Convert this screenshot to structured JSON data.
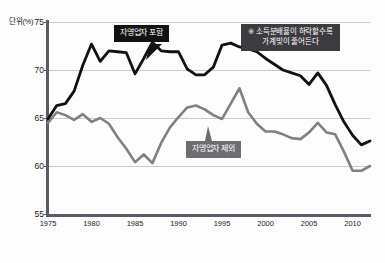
{
  "axis": {
    "unit_label": "단위(%)",
    "y_ticks": [
      55,
      60,
      65,
      70,
      75
    ],
    "y_tick_labels": [
      "55",
      "60",
      "65",
      "70",
      "75"
    ],
    "x_ticks": [
      1975,
      1980,
      1985,
      1990,
      1995,
      2000,
      2005,
      2010
    ],
    "x_tick_labels": [
      "1975",
      "1980",
      "1985",
      "1990",
      "1995",
      "2000",
      "2005",
      "2010"
    ]
  },
  "callouts": {
    "included": "자영업자 포함",
    "excluded": "자영업자 제외",
    "note_line1": "※ 소득분배율이 하락할수록",
    "note_line2": "가계빚이 줄어든다"
  },
  "colors": {
    "series_included": "#111111",
    "series_excluded": "#808086",
    "gridline": "#c9c9cf",
    "axis": "#5b5b66",
    "callout_included_bg": "#121212",
    "callout_excluded_bg": "#6e6e72",
    "callout_note_bg": "#3c3c40",
    "background": "#fdfdfd"
  },
  "chart_data": {
    "type": "line",
    "title": "",
    "xlabel": "",
    "ylabel": "단위(%)",
    "xlim": [
      1975,
      2012
    ],
    "ylim": [
      55,
      75
    ],
    "grid": true,
    "legend_position": "inline-callouts",
    "x": [
      1975,
      1976,
      1977,
      1978,
      1979,
      1980,
      1981,
      1982,
      1983,
      1984,
      1985,
      1986,
      1987,
      1988,
      1989,
      1990,
      1991,
      1992,
      1993,
      1994,
      1995,
      1996,
      1997,
      1998,
      1999,
      2000,
      2001,
      2002,
      2003,
      2004,
      2005,
      2006,
      2007,
      2008,
      2009,
      2010,
      2011,
      2012
    ],
    "series": [
      {
        "name": "자영업자 포함",
        "color": "#111111",
        "values": [
          64.9,
          66.3,
          66.5,
          67.8,
          70.5,
          72.7,
          70.9,
          72.0,
          71.9,
          71.8,
          69.6,
          71.2,
          72.9,
          72.0,
          71.9,
          71.9,
          70.1,
          69.5,
          69.5,
          70.3,
          72.6,
          72.8,
          72.4,
          72.2,
          71.9,
          71.2,
          70.6,
          70.0,
          69.7,
          69.4,
          68.5,
          69.7,
          68.4,
          66.4,
          64.6,
          63.2,
          62.2,
          62.6
        ]
      },
      {
        "name": "자영업자 제외",
        "color": "#808086",
        "values": [
          64.5,
          65.6,
          65.3,
          64.8,
          65.4,
          64.6,
          65.0,
          64.4,
          63.0,
          61.8,
          60.4,
          61.2,
          60.3,
          62.4,
          64.0,
          65.1,
          66.1,
          66.3,
          65.9,
          65.3,
          64.9,
          66.5,
          68.1,
          65.6,
          64.4,
          63.6,
          63.6,
          63.3,
          62.9,
          62.8,
          63.5,
          64.5,
          63.5,
          63.3,
          61.5,
          59.5,
          59.5,
          60.0
        ]
      }
    ]
  }
}
